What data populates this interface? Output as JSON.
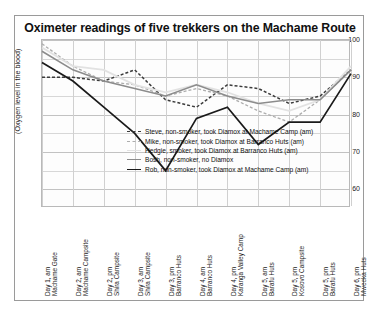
{
  "chart_data": {
    "type": "line",
    "title": "Oximeter readings of five trekkers on the Machame Route",
    "xlabel": "",
    "ylabel": "(Oxygen level in the blood)",
    "ylim": [
      55,
      100
    ],
    "yticks": [
      100,
      90,
      80,
      70,
      60
    ],
    "yminor": [
      95,
      85,
      75,
      65
    ],
    "grid": true,
    "legend_position": "inside-center-right",
    "categories": [
      "Day 1, am\nMachame Gate",
      "Day 2, am\nMachame Campsite",
      "Day 2, pm\nShira Campsite",
      "Day 3, am\nShira Campsite",
      "Day 3, pm\nBarranco Huts",
      "Day 4, am\nBarranco Huts",
      "Day 4, pm\nKaranga Valley Camp",
      "Day 5, am\nBarafu Huts",
      "Day 5, pm\nKosovo Campsite",
      "Day 5, pm\nBarafu Huts",
      "Day 6, pm\nMweeka Huts"
    ],
    "series": [
      {
        "name": "Steve, non-smoker, took Diamox at Machame Camp (am)",
        "style": "dashed",
        "color": "#3b3b3b",
        "width": 1.5,
        "values": [
          90,
          90,
          89,
          92,
          84,
          82,
          88,
          87,
          83,
          85,
          92
        ]
      },
      {
        "name": "Mike, non-smoker, took Diamox at Barranco Huts (am)",
        "style": "dashed",
        "color": "#adadad",
        "width": 1.3,
        "values": [
          99,
          93,
          89,
          88,
          85,
          87,
          85,
          81,
          78,
          84,
          92
        ]
      },
      {
        "name": "Hedgie, smoker, took Diamox at Barranco Huts (am)",
        "style": "solid",
        "color": "#e2e2e2",
        "width": 1.8,
        "values": [
          98,
          93,
          92,
          88,
          86,
          88,
          86,
          83,
          81,
          84,
          93
        ]
      },
      {
        "name": "Bosh, non-smoker, no Diamox",
        "style": "solid",
        "color": "#8c8c8c",
        "width": 1.6,
        "values": [
          97,
          92,
          89,
          87,
          85,
          88,
          85,
          83,
          84,
          84,
          92
        ]
      },
      {
        "name": "Rob, non-smoker, took Diamox at Machame Camp (am)",
        "style": "solid",
        "color": "#1a1a1a",
        "width": 1.7,
        "values": [
          94,
          89,
          82,
          75,
          65,
          79,
          82,
          72,
          78,
          78,
          91
        ]
      }
    ]
  }
}
